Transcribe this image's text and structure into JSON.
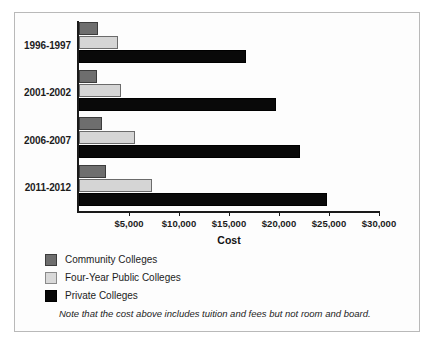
{
  "chart_data": {
    "type": "bar",
    "orientation": "horizontal",
    "title": "",
    "xlabel": "Cost",
    "ylabel": "",
    "xlim": [
      0,
      30000
    ],
    "grid": false,
    "legend_position": "below-plot-left",
    "categories": [
      "1996-1997",
      "2001-2002",
      "2006-2007",
      "2011-2012"
    ],
    "tick_labels": [
      "$5,000",
      "$10,000",
      "$15,000",
      "$20,000",
      "$25,000",
      "$30,000"
    ],
    "tick_values": [
      5000,
      10000,
      15000,
      20000,
      25000,
      30000
    ],
    "series": [
      {
        "name": "Community Colleges",
        "color": "#6e6e6e",
        "values": [
          1900,
          1800,
          2300,
          2700
        ]
      },
      {
        "name": "Four-Year Public Colleges",
        "color": "#d5d5d5",
        "values": [
          3900,
          4200,
          5600,
          7300
        ]
      },
      {
        "name": "Private Colleges",
        "color": "#090909",
        "values": [
          16700,
          19700,
          22100,
          24800
        ]
      }
    ],
    "annotations": [
      "Note that the cost above includes tuition and fees but not room and board."
    ]
  },
  "note": "Note that the cost above includes tuition and fees but not room and board."
}
